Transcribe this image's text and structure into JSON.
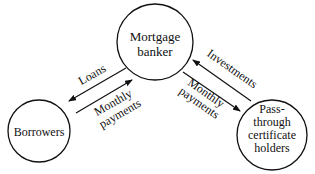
{
  "diagram": {
    "nodes": [
      {
        "id": "mortgage-banker",
        "lines": [
          "Mortgage",
          "banker"
        ]
      },
      {
        "id": "borrowers",
        "lines": [
          "Borrowers"
        ]
      },
      {
        "id": "pass-through",
        "lines": [
          "Pass-",
          "through",
          "certificate",
          "holders"
        ]
      }
    ],
    "edges": [
      {
        "from": "mortgage-banker",
        "to": "borrowers",
        "label": "Loans"
      },
      {
        "from": "borrowers",
        "to": "mortgage-banker",
        "label_lines": [
          "Monthly",
          "payments"
        ]
      },
      {
        "from": "pass-through",
        "to": "mortgage-banker",
        "label": "Investments"
      },
      {
        "from": "mortgage-banker",
        "to": "pass-through",
        "label_lines": [
          "Monthly",
          "payments"
        ]
      }
    ]
  }
}
